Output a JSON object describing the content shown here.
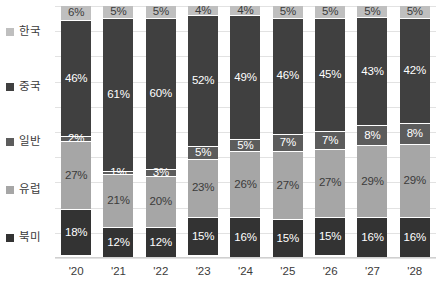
{
  "chart_data": {
    "type": "bar",
    "stacked": true,
    "orientation": "vertical",
    "title": "",
    "subtitle": "",
    "xlabel": "",
    "ylabel": "",
    "ylim": [
      0,
      100
    ],
    "unit": "%",
    "grid": true,
    "legend_position": "left",
    "categories": [
      "'20",
      "'21",
      "'22",
      "'23",
      "'24",
      "'25",
      "'26",
      "'27",
      "'28"
    ],
    "stack_order_bottom_to_top": [
      "북미",
      "유럽",
      "일반",
      "중국",
      "한국"
    ],
    "series": [
      {
        "name": "한국",
        "color": "#bfbfbf",
        "label_color": "#3b3b3b",
        "values": [
          6,
          5,
          5,
          4,
          4,
          5,
          5,
          5,
          5
        ],
        "labels": [
          "6%",
          "5%",
          "5%",
          "4%",
          "4%",
          "5%",
          "5%",
          "5%",
          "5%"
        ]
      },
      {
        "name": "중국",
        "color": "#404040",
        "label_color": "#ffffff",
        "values": [
          46,
          61,
          60,
          52,
          49,
          46,
          45,
          43,
          42
        ],
        "labels": [
          "46%",
          "61%",
          "60%",
          "52%",
          "49%",
          "46%",
          "45%",
          "43%",
          "42%"
        ]
      },
      {
        "name": "일반",
        "color": "#5c5c5c",
        "label_color": "#ffffff",
        "values": [
          2,
          1,
          3,
          5,
          5,
          7,
          7,
          8,
          8
        ],
        "labels": [
          "2%",
          "1%",
          "3%",
          "5%",
          "5%",
          "7%",
          "7%",
          "8%",
          "8%"
        ]
      },
      {
        "name": "유럽",
        "color": "#a6a6a6",
        "label_color": "#3b3b3b",
        "values": [
          27,
          21,
          20,
          23,
          26,
          27,
          27,
          29,
          29
        ],
        "labels": [
          "27%",
          "21%",
          "20%",
          "23%",
          "26%",
          "27%",
          "27%",
          "29%",
          "29%"
        ]
      },
      {
        "name": "북미",
        "color": "#333333",
        "label_color": "#ffffff",
        "values": [
          18,
          12,
          12,
          15,
          16,
          15,
          15,
          16,
          16
        ],
        "labels": [
          "18%",
          "12%",
          "12%",
          "15%",
          "16%",
          "15%",
          "15%",
          "16%",
          "16%"
        ]
      }
    ]
  },
  "legend": {
    "items": [
      {
        "label": "한국",
        "color": "#bfbfbf",
        "top": 26
      },
      {
        "label": "중국",
        "color": "#404040",
        "top": 81
      },
      {
        "label": "일반",
        "color": "#5c5c5c",
        "top": 136
      },
      {
        "label": "유럽",
        "color": "#a6a6a6",
        "top": 184
      },
      {
        "label": "북미",
        "color": "#333333",
        "top": 232
      }
    ]
  },
  "axis": {
    "gridline_count": 11,
    "gridline_color": "#e2e2e2"
  }
}
